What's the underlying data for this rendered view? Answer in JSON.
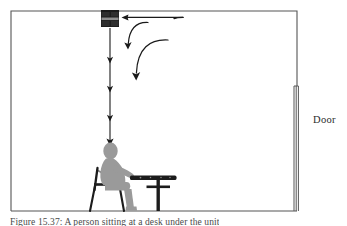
{
  "figure": {
    "caption": "Figure 15.37: A person sitting at a desk under the unit",
    "door_label": "Door",
    "colors": {
      "room_outline": "#555555",
      "person_fill": "#9a9a9a",
      "furniture_fill": "#1c1c1c",
      "unit_fill": "#1a1a1a",
      "arrow_stroke": "#1a1a1a",
      "door_stroke": "#555555",
      "background": "#ffffff"
    },
    "scene": {
      "room": {
        "left": 11,
        "top": 11,
        "right": 297,
        "floor_y": 211
      },
      "ceiling_unit": {
        "x": 101,
        "y": 10,
        "width": 18,
        "height": 17,
        "band_y": 18,
        "band_height": 3,
        "name": "ceiling mounted unit"
      },
      "door": {
        "x": 294,
        "top": 86,
        "bottom": 211,
        "width": 5,
        "panel_lines": 3
      },
      "downward_jet": {
        "x": 110,
        "from_y": 28,
        "to_y": 143,
        "arrowhead_ys": [
          60,
          89,
          118,
          143
        ],
        "name": "vertical downward airflow"
      },
      "intake_arrow": {
        "from_x": 183,
        "to_x": 123,
        "y": 18,
        "name": "horizontal return air arrow"
      },
      "curved_arrows": [
        {
          "name": "inner curved airflow arrow",
          "start_x": 146,
          "start_y": 22,
          "end_x": 128,
          "end_y": 47
        },
        {
          "name": "outer curved airflow arrow",
          "start_x": 165,
          "start_y": 40,
          "end_x": 136,
          "end_y": 78
        }
      ],
      "person": {
        "name": "seated person silhouette",
        "head_center_x": 110,
        "head_center_y": 150,
        "seat_y": 182,
        "foot_y": 211
      },
      "chair": {
        "name": "chair",
        "back_top_y": 168,
        "seat_y": 184,
        "leg_bottom_y": 211
      },
      "desk": {
        "name": "desk",
        "top_y": 176,
        "left_x": 131,
        "right_x": 176,
        "pedestal_x": 159,
        "foot_y": 211
      }
    }
  }
}
